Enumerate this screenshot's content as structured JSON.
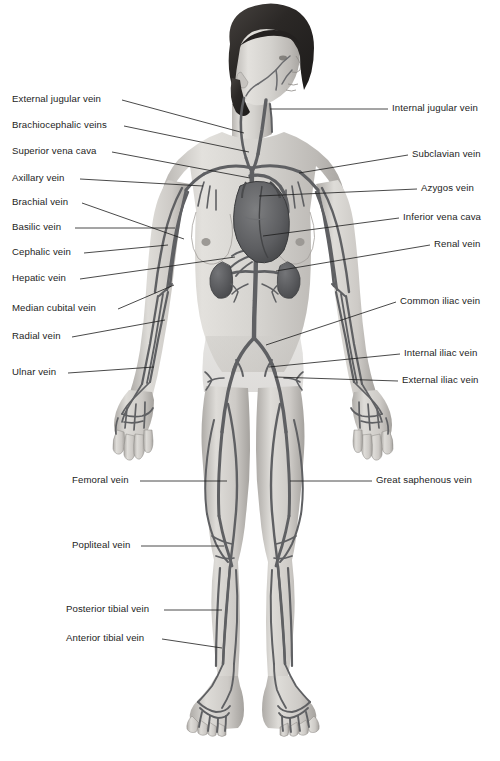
{
  "figure": {
    "background_color": "#ffffff",
    "vein_color": "#5f6063",
    "skin_color": "#d8d6d2",
    "hair_color": "#2f2c2b",
    "label_color": "#242424",
    "leader_color": "#1c1c1c"
  },
  "labels_left": [
    {
      "id": "external-jugular-vein",
      "text": "External jugular vein",
      "x": 12,
      "y": 93,
      "anchor_x": 122,
      "anchor_y": 100,
      "target_x": 244,
      "target_y": 133
    },
    {
      "id": "brachiocephalic-veins",
      "text": "Brachiocephalic veins",
      "x": 12,
      "y": 119,
      "anchor_x": 124,
      "anchor_y": 126,
      "target_x": 249,
      "target_y": 152
    },
    {
      "id": "superior-vena-cava",
      "text": "Superior vena cava",
      "x": 12,
      "y": 145,
      "anchor_x": 112,
      "anchor_y": 152,
      "target_x": 250,
      "target_y": 178
    },
    {
      "id": "axillary-vein",
      "text": "Axillary vein",
      "x": 12,
      "y": 172,
      "anchor_x": 80,
      "anchor_y": 179,
      "target_x": 203,
      "target_y": 186
    },
    {
      "id": "brachial-vein",
      "text": "Brachial vein",
      "x": 12,
      "y": 196,
      "anchor_x": 82,
      "anchor_y": 203,
      "target_x": 184,
      "target_y": 239
    },
    {
      "id": "basilic-vein",
      "text": "Basilic vein",
      "x": 12,
      "y": 221,
      "anchor_x": 75,
      "anchor_y": 228,
      "target_x": 175,
      "target_y": 228
    },
    {
      "id": "cephalic-vein",
      "text": "Cephalic vein",
      "x": 12,
      "y": 246,
      "anchor_x": 84,
      "anchor_y": 253,
      "target_x": 168,
      "target_y": 245
    },
    {
      "id": "hepatic-vein",
      "text": "Hepatic vein",
      "x": 12,
      "y": 272,
      "anchor_x": 80,
      "anchor_y": 279,
      "target_x": 235,
      "target_y": 257
    },
    {
      "id": "median-cubital-vein",
      "text": "Median cubital vein",
      "x": 12,
      "y": 302,
      "anchor_x": 118,
      "anchor_y": 309,
      "target_x": 174,
      "target_y": 285
    },
    {
      "id": "radial-vein",
      "text": "Radial vein",
      "x": 12,
      "y": 330,
      "anchor_x": 72,
      "anchor_y": 337,
      "target_x": 165,
      "target_y": 320
    },
    {
      "id": "ulnar-vein",
      "text": "Ulnar vein",
      "x": 12,
      "y": 366,
      "anchor_x": 68,
      "anchor_y": 373,
      "target_x": 154,
      "target_y": 367
    },
    {
      "id": "femoral-vein",
      "text": "Femoral vein",
      "x": 72,
      "y": 474,
      "anchor_x": 140,
      "anchor_y": 481,
      "target_x": 227,
      "target_y": 481
    },
    {
      "id": "popliteal-vein",
      "text": "Popliteal vein",
      "x": 72,
      "y": 539,
      "anchor_x": 141,
      "anchor_y": 546,
      "target_x": 224,
      "target_y": 546
    },
    {
      "id": "posterior-tibial-vein",
      "text": "Posterior tibial vein",
      "x": 66,
      "y": 603,
      "anchor_x": 164,
      "anchor_y": 610,
      "target_x": 222,
      "target_y": 610
    },
    {
      "id": "anterior-tibial-vein",
      "text": "Anterior tibial vein",
      "x": 66,
      "y": 632,
      "anchor_x": 162,
      "anchor_y": 639,
      "target_x": 222,
      "target_y": 648
    }
  ],
  "labels_right": [
    {
      "id": "internal-jugular-vein",
      "text": "Internal jugular vein",
      "x": 392,
      "y": 102,
      "anchor_x": 388,
      "anchor_y": 109,
      "target_x": 270,
      "target_y": 109
    },
    {
      "id": "subclavian-vein",
      "text": "Subclavian vein",
      "x": 412,
      "y": 148,
      "anchor_x": 408,
      "anchor_y": 155,
      "target_x": 299,
      "target_y": 173
    },
    {
      "id": "azygos-vein",
      "text": "Azygos vein",
      "x": 421,
      "y": 182,
      "anchor_x": 417,
      "anchor_y": 189,
      "target_x": 259,
      "target_y": 196
    },
    {
      "id": "inferior-vena-cava",
      "text": "Inferior vena cava",
      "x": 403,
      "y": 211,
      "anchor_x": 399,
      "anchor_y": 218,
      "target_x": 263,
      "target_y": 236
    },
    {
      "id": "renal-vein",
      "text": "Renal vein",
      "x": 434,
      "y": 238,
      "anchor_x": 430,
      "anchor_y": 245,
      "target_x": 276,
      "target_y": 271
    },
    {
      "id": "common-iliac-vein",
      "text": "Common iliac vein",
      "x": 400,
      "y": 295,
      "anchor_x": 396,
      "anchor_y": 302,
      "target_x": 266,
      "target_y": 345
    },
    {
      "id": "internal-iliac-vein",
      "text": "Internal iliac vein",
      "x": 404,
      "y": 347,
      "anchor_x": 400,
      "anchor_y": 354,
      "target_x": 269,
      "target_y": 367
    },
    {
      "id": "external-iliac-vein",
      "text": "External iliac vein",
      "x": 402,
      "y": 374,
      "anchor_x": 398,
      "anchor_y": 381,
      "target_x": 275,
      "target_y": 377
    },
    {
      "id": "great-saphenous-vein",
      "text": "Great saphenous vein",
      "x": 376,
      "y": 474,
      "anchor_x": 372,
      "anchor_y": 481,
      "target_x": 290,
      "target_y": 481
    }
  ]
}
